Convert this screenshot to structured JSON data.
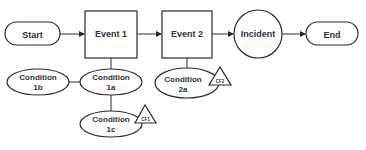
{
  "nodes": {
    "start": {
      "label": "Start"
    },
    "event1": {
      "label": "Event 1"
    },
    "event2": {
      "label": "Event 2"
    },
    "incident": {
      "label": "Incident"
    },
    "end": {
      "label": "End"
    },
    "cond1b": {
      "line1": "Condition",
      "line2": "1b"
    },
    "cond1a": {
      "line1": "Condition",
      "line2": "1a"
    },
    "cond1c": {
      "line1": "Condition",
      "line2": "1c"
    },
    "cond2a": {
      "line1": "Condition",
      "line2": "2a"
    }
  },
  "flags": {
    "cf1": {
      "label": "CF1"
    },
    "cf2": {
      "label": "CF2"
    }
  },
  "colors": {
    "stroke": "#2a2a2a",
    "text": "#333333",
    "background": "#ffffff"
  }
}
